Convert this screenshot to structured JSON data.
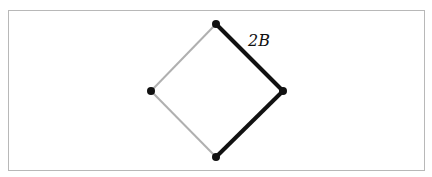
{
  "diagram": {
    "type": "lattice-diamond",
    "vertices": [
      {
        "id": "top",
        "x": 216,
        "y": 24
      },
      {
        "id": "right",
        "x": 283,
        "y": 91
      },
      {
        "id": "bottom",
        "x": 216,
        "y": 157
      },
      {
        "id": "left",
        "x": 151,
        "y": 91
      }
    ],
    "edges": [
      {
        "from": "top",
        "to": "right",
        "style": "bold",
        "color": "#111111"
      },
      {
        "from": "right",
        "to": "bottom",
        "style": "bold",
        "color": "#111111"
      },
      {
        "from": "top",
        "to": "left",
        "style": "light",
        "color": "#b0b0b0"
      },
      {
        "from": "left",
        "to": "bottom",
        "style": "light",
        "color": "#b0b0b0"
      }
    ],
    "annotation": {
      "text": "2B",
      "x": 248,
      "y": 46
    }
  }
}
